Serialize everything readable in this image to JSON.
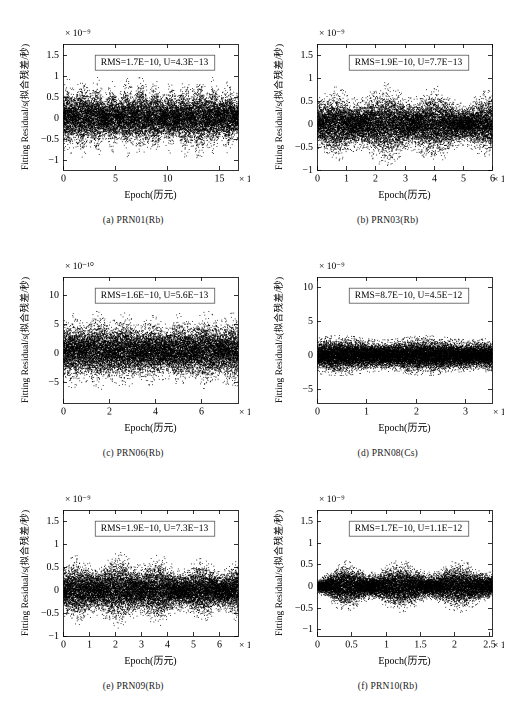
{
  "figure": {
    "y_axis_label": "Fitting Residual/s(拟合残差/秒)",
    "x_axis_label": "Epoch(历元)",
    "multiplier_prefix": "× 10",
    "point_color": "#000000",
    "axis_color": "#000000",
    "background_color": "#ffffff",
    "annotation_box_color": "#ffffff",
    "annotation_border_color": "#555555"
  },
  "chart_data": [
    {
      "type": "scatter",
      "panel_id": "a",
      "caption": "(a) PRN01(Rb)",
      "satellite": "PRN01",
      "clock_type": "Rb",
      "title": "",
      "xlabel": "Epoch(历元)",
      "ylabel": "Fitting Residual/s(拟合残差/秒)",
      "annotation": "RMS=1.7E−10, U=4.3E−13",
      "rms": "1.7E−10",
      "uncertainty": "4.3E−13",
      "x_exponent": "4",
      "y_exponent": "-9",
      "x_exponent_label": "× 10⁴",
      "y_exponent_label": "× 10⁻⁹",
      "xlim": [
        0,
        16.8
      ],
      "ylim": [
        -1.25,
        1.75
      ],
      "xticks": [
        0,
        5,
        10,
        15
      ],
      "xticklabels": [
        "0",
        "5",
        "10",
        "15"
      ],
      "yticks": [
        -1,
        -0.5,
        0,
        0.5,
        1,
        1.5
      ],
      "yticklabels": [
        "−1",
        "−0.5",
        "0",
        "0.5",
        "1",
        "1.5"
      ],
      "grid": false,
      "envelope": {
        "shape": "oscillatory",
        "base_amplitude": 0.42,
        "modulation_depth": 0.34,
        "cycles": 12,
        "upper_bias": 0.06,
        "seed": 11
      },
      "n_points": 5200,
      "description": "Dense black residual band with ~12 periodic lobes, amplitude roughly ±0.5E-9 peaking near ±0.8E-9."
    },
    {
      "type": "scatter",
      "panel_id": "b",
      "caption": "(b) PRN03(Rb)",
      "satellite": "PRN03",
      "clock_type": "Rb",
      "title": "",
      "xlabel": "Epoch(历元)",
      "ylabel": "Fitting Residual/s(拟合残差/秒)",
      "annotation": "RMS=1.9E−10, U=7.7E−13",
      "rms": "1.9E−10",
      "uncertainty": "7.7E−13",
      "x_exponent": "4",
      "y_exponent": "-9",
      "x_exponent_label": "× 10⁴",
      "y_exponent_label": "× 10⁻⁹",
      "xlim": [
        0,
        6.0
      ],
      "ylim": [
        -1.0,
        1.75
      ],
      "xticks": [
        0,
        1,
        2,
        3,
        4,
        5,
        6
      ],
      "xticklabels": [
        "0",
        "1",
        "2",
        "3",
        "4",
        "5",
        "6"
      ],
      "yticks": [
        -1,
        -0.5,
        0,
        0.5,
        1,
        1.5
      ],
      "yticklabels": [
        "−1",
        "−0.5",
        "0",
        "0.5",
        "1",
        "1.5"
      ],
      "grid": false,
      "envelope": {
        "shape": "oscillatory",
        "base_amplitude": 0.33,
        "modulation_depth": 0.33,
        "cycles": 3.4,
        "upper_bias": 0.04,
        "seed": 23
      },
      "n_points": 5200,
      "description": "Three broad bulges peaking near epochs 1, 2.8 and 4.4 (×10^4), amplitude to about ±0.75E-9."
    },
    {
      "type": "scatter",
      "panel_id": "c",
      "caption": "(c) PRN06(Rb)",
      "satellite": "PRN06",
      "clock_type": "Rb",
      "title": "",
      "xlabel": "Epoch(历元)",
      "ylabel": "Fitting Residual/s(拟合残差/秒)",
      "annotation": "RMS=1.6E−10, U=5.6E−13",
      "rms": "1.6E−10",
      "uncertainty": "5.6E−13",
      "x_exponent": "4",
      "y_exponent": "-10",
      "x_exponent_label": "× 10⁴",
      "y_exponent_label": "× 10⁻¹⁰",
      "xlim": [
        0,
        7.6
      ],
      "ylim": [
        -8.5,
        13.0
      ],
      "xticks": [
        0,
        2,
        4,
        6
      ],
      "xticklabels": [
        "0",
        "2",
        "4",
        "6"
      ],
      "yticks": [
        -5,
        0,
        5,
        10
      ],
      "yticklabels": [
        "−5",
        "0",
        "5",
        "10"
      ],
      "grid": false,
      "envelope": {
        "shape": "oscillatory",
        "base_amplitude": 3.6,
        "modulation_depth": 1.5,
        "cycles": 6.5,
        "upper_bias": 0.4,
        "seed": 37
      },
      "n_points": 5200,
      "description": "Residual band about ±5E-10 with mild periodic modulation across the full epoch span."
    },
    {
      "type": "scatter",
      "panel_id": "d",
      "caption": "(d) PRN08(Cs)",
      "satellite": "PRN08",
      "clock_type": "Cs",
      "title": "",
      "xlabel": "Epoch(历元)",
      "ylabel": "Fitting Residual/s(拟合残差/秒)",
      "annotation": "RMS=8.7E−10, U=4.5E−12",
      "rms": "8.7E−10",
      "uncertainty": "4.5E−12",
      "x_exponent": "4",
      "y_exponent": "-9",
      "x_exponent_label": "× 10⁴",
      "y_exponent_label": "× 10⁻⁹",
      "xlim": [
        0,
        3.55
      ],
      "ylim": [
        -7.0,
        11.5
      ],
      "xticks": [
        0,
        1,
        2,
        3
      ],
      "xticklabels": [
        "0",
        "1",
        "2",
        "3"
      ],
      "yticks": [
        -5,
        0,
        5,
        10
      ],
      "yticklabels": [
        "−5",
        "0",
        "5",
        "10"
      ],
      "grid": false,
      "envelope": {
        "shape": "flat",
        "base_amplitude": 2.1,
        "modulation_depth": 0.12,
        "cycles": 2,
        "upper_bias": 0.05,
        "seed": 53
      },
      "n_points": 6000,
      "description": "Uniform flat white-noise band of roughly ±2.3E-9, no periodic structure (caesium clock)."
    },
    {
      "type": "scatter",
      "panel_id": "e",
      "caption": "(e) PRN09(Rb)",
      "satellite": "PRN09",
      "clock_type": "Rb",
      "title": "",
      "xlabel": "Epoch(历元)",
      "ylabel": "Fitting Residual/s(拟合残差/秒)",
      "annotation": "RMS=1.9E−10, U=7.3E−13",
      "rms": "1.9E−10",
      "uncertainty": "7.3E−13",
      "x_exponent": "4",
      "y_exponent": "-9",
      "x_exponent_label": "× 10⁴",
      "y_exponent_label": "× 10⁻⁹",
      "xlim": [
        0,
        6.75
      ],
      "ylim": [
        -1.0,
        1.75
      ],
      "xticks": [
        0,
        1,
        2,
        3,
        4,
        5,
        6
      ],
      "xticklabels": [
        "0",
        "1",
        "2",
        "3",
        "4",
        "5",
        "6"
      ],
      "yticks": [
        -1,
        -0.5,
        0,
        0.5,
        1,
        1.5
      ],
      "yticklabels": [
        "−1",
        "−0.5",
        "0",
        "0.5",
        "1",
        "1.5"
      ],
      "grid": false,
      "envelope": {
        "shape": "oscillatory",
        "base_amplitude": 0.33,
        "modulation_depth": 0.28,
        "cycles": 4.2,
        "upper_bias": 0.05,
        "seed": 71
      },
      "n_points": 5200,
      "description": "Wavy residual band with maxima near epochs 0.6, 2.3, 4.1 and 5.6 (×10^4), amplitude to about ±0.8E-9."
    },
    {
      "type": "scatter",
      "panel_id": "f",
      "caption": "(f) PRN10(Rb)",
      "satellite": "PRN10",
      "clock_type": "Rb",
      "title": "",
      "xlabel": "Epoch(历元)",
      "ylabel": "Fitting Residual/s(拟合残差/秒)",
      "annotation": "RMS=1.7E−10, U=1.1E−12",
      "rms": "1.7E−10",
      "uncertainty": "1.1E−12",
      "x_exponent": "4",
      "y_exponent": "-9",
      "x_exponent_label": "× 10⁴",
      "y_exponent_label": "× 10⁻⁹",
      "xlim": [
        0,
        2.55
      ],
      "ylim": [
        -1.15,
        1.75
      ],
      "xticks": [
        0,
        0.5,
        1,
        1.5,
        2,
        2.5
      ],
      "xticklabels": [
        "0",
        "0.5",
        "1",
        "1.5",
        "2",
        "2.5"
      ],
      "yticks": [
        -1,
        -0.5,
        0,
        0.5,
        1,
        1.5
      ],
      "yticklabels": [
        "−1",
        "−0.5",
        "0",
        "0.5",
        "1",
        "1.5"
      ],
      "grid": false,
      "envelope": {
        "shape": "segmented",
        "base_amplitude": 0.26,
        "modulation_depth": 0.22,
        "cycles": 3.0,
        "upper_bias": 0.04,
        "seed": 97
      },
      "n_points": 5000,
      "description": "Narrow band near the start, widening after epoch 0.4 with bulges near 0.9 and 2.3 (×10^4)."
    }
  ]
}
